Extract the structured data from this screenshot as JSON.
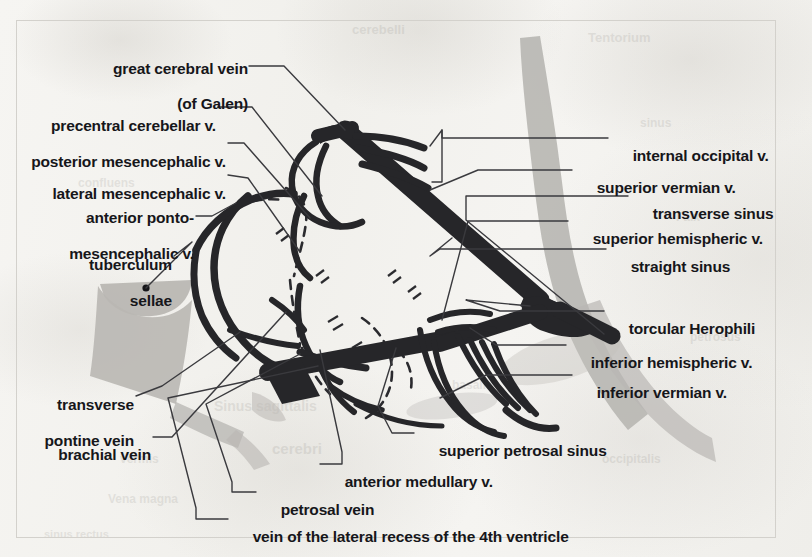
{
  "figure": {
    "kind": "anatomical-illustration",
    "frame_border_color": "#d3d1cc",
    "paper_color": "#f4f3f0",
    "vessel_color": "#262629",
    "shading_color": "#b8b6b2",
    "leader_line_color": "#3a3a3e",
    "text_color": "#16161a"
  },
  "labels_left": [
    {
      "id": "great-cerebral-vein",
      "line1": "great cerebral vein",
      "line2": "(of Galen)"
    },
    {
      "id": "precentral-cerebellar-v",
      "line1": "precentral cerebellar v."
    },
    {
      "id": "posterior-mesencephalic-v",
      "line1": "posterior mesencephalic v."
    },
    {
      "id": "lateral-mesencephalic-v",
      "line1": "lateral mesencephalic v."
    },
    {
      "id": "anterior-pontomesencephalic-v",
      "line1": "anterior ponto-",
      "line2": "mesencephalic v."
    },
    {
      "id": "tuberculum-sellae",
      "line1": "tuberculum",
      "line2": "sellae"
    },
    {
      "id": "transverse-pontine-vein",
      "line1": "transverse",
      "line2": "pontine vein"
    },
    {
      "id": "brachial-vein",
      "line1": "brachial vein"
    }
  ],
  "labels_right": [
    {
      "id": "internal-occipital-v",
      "text": "internal occipital v."
    },
    {
      "id": "superior-vermian-v",
      "text": "superior vermian v."
    },
    {
      "id": "transverse-sinus",
      "text": "transverse sinus"
    },
    {
      "id": "superior-hemispheric-v",
      "text": "superior hemispheric v."
    },
    {
      "id": "straight-sinus",
      "text": "straight sinus"
    },
    {
      "id": "torcular-herophili",
      "text": "torcular Herophili"
    },
    {
      "id": "inferior-hemispheric-v",
      "text": "inferior hemispheric v."
    },
    {
      "id": "inferior-vermian-v",
      "text": "inferior vermian v."
    }
  ],
  "labels_bottom": [
    {
      "id": "superior-petrosal-sinus",
      "text": "superior petrosal sinus"
    },
    {
      "id": "anterior-medullary-v",
      "text": "anterior medullary v."
    },
    {
      "id": "petrosal-vein",
      "text": "petrosal vein"
    },
    {
      "id": "vein-of-lateral-recess",
      "text": "vein of the lateral recess of the 4th ventricle"
    }
  ],
  "ghost_text": [
    {
      "text": "Tentorium",
      "x": 588,
      "y": 30,
      "size": 13,
      "rot": 0
    },
    {
      "text": "cerebelli",
      "x": 352,
      "y": 22,
      "size": 13,
      "rot": 0
    },
    {
      "text": "sinus",
      "x": 640,
      "y": 116,
      "size": 12,
      "rot": 0
    },
    {
      "text": "confluens",
      "x": 78,
      "y": 176,
      "size": 12,
      "rot": 0
    },
    {
      "text": "Falx",
      "x": 676,
      "y": 210,
      "size": 12,
      "rot": 0
    },
    {
      "text": "petrosus",
      "x": 690,
      "y": 330,
      "size": 12,
      "rot": 0
    },
    {
      "text": "basalis",
      "x": 452,
      "y": 378,
      "size": 12,
      "rot": 0
    },
    {
      "text": "Sinus sagittalis",
      "x": 214,
      "y": 398,
      "size": 14,
      "rot": 0
    },
    {
      "text": "cerebri",
      "x": 272,
      "y": 440,
      "size": 15,
      "rot": 0
    },
    {
      "text": "vermis",
      "x": 120,
      "y": 452,
      "size": 12,
      "rot": 0
    },
    {
      "text": "Vena magna",
      "x": 108,
      "y": 492,
      "size": 12,
      "rot": 0
    },
    {
      "text": "occipitalis",
      "x": 602,
      "y": 452,
      "size": 12,
      "rot": 0
    },
    {
      "text": "sinus rectus",
      "x": 44,
      "y": 528,
      "size": 11,
      "rot": 0
    }
  ]
}
